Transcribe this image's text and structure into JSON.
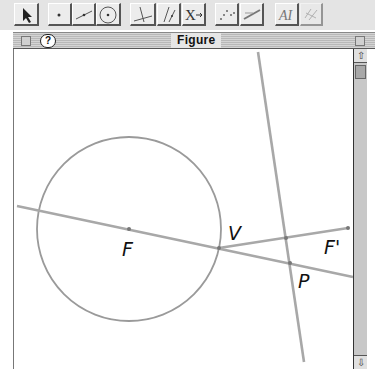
{
  "toolbar": {
    "buttons": [
      {
        "name": "arrow-tool",
        "icon": "arrow-icon"
      },
      {
        "name": "point-tool",
        "icon": "point-icon"
      },
      {
        "name": "segment-tool",
        "icon": "segment-icon"
      },
      {
        "name": "circle-tool",
        "icon": "circle-icon"
      },
      {
        "name": "perpendicular-tool",
        "icon": "perpendicular-icon"
      },
      {
        "name": "parallel-tool",
        "icon": "parallel-icon"
      },
      {
        "name": "transform-tool",
        "icon": "transform-icon",
        "label": "X"
      },
      {
        "name": "locus-tool",
        "icon": "locus-icon"
      },
      {
        "name": "measure-tool",
        "icon": "measure-icon"
      },
      {
        "name": "text-tool",
        "icon": "text-icon",
        "label": "AI"
      },
      {
        "name": "hide-tool",
        "icon": "hide-icon",
        "disabled": true
      }
    ]
  },
  "window": {
    "title": "Figure",
    "help_label": "?"
  },
  "figure": {
    "labels": {
      "F": "F",
      "V": "V",
      "F_prime": "F'",
      "P": "P"
    },
    "circle": {
      "cx": 129,
      "cy": 229,
      "r": 92
    },
    "points": {
      "F": [
        129,
        229
      ],
      "V": [
        219,
        248
      ],
      "F_prime": [
        348,
        228
      ],
      "P": [
        290,
        263
      ],
      "Q": [
        286,
        238
      ]
    },
    "colors": {
      "line": "#a8a8a8",
      "circle": "#9a9a9a",
      "point": "#777777"
    }
  },
  "scrollbar": {
    "up": "⇧",
    "down": "⇩"
  }
}
